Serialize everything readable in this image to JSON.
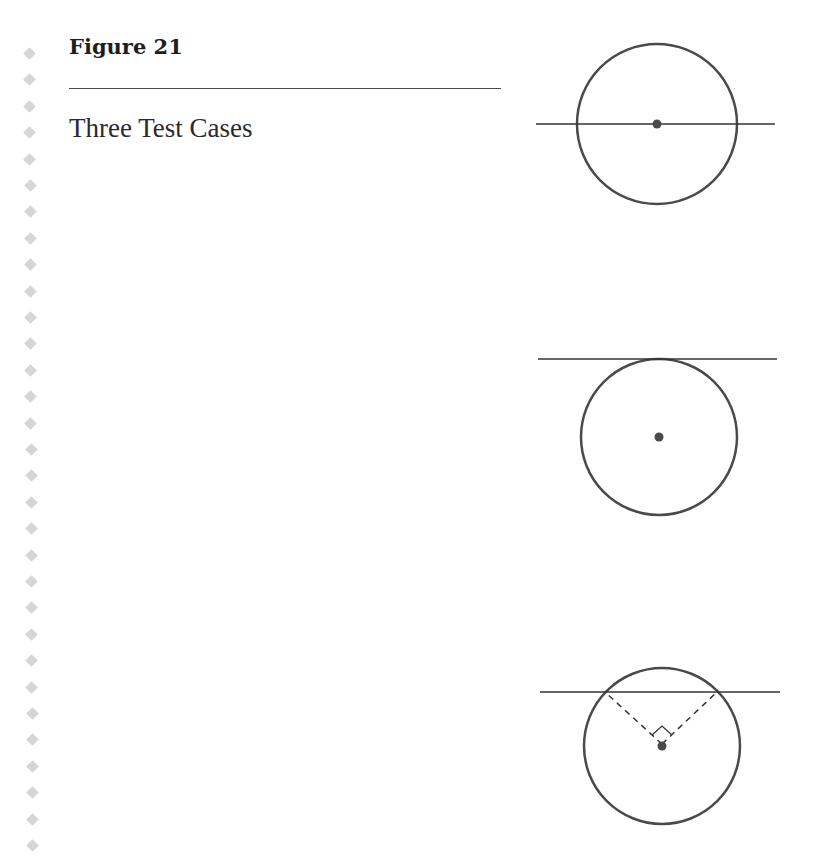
{
  "figure": {
    "title": "Figure 21",
    "subtitle": "Three Test Cases"
  },
  "diagram": {
    "colors": {
      "stroke": "#4a4a4a",
      "line": "#333333",
      "center_dot": "#4a4a4a",
      "bullet": "#d6d6d6"
    },
    "cases": [
      {
        "name": "line-through-center",
        "circle": {
          "cx": 657,
          "cy": 124,
          "r": 80
        },
        "line": {
          "x1": 536,
          "x2": 775,
          "y": 124
        }
      },
      {
        "name": "tangent-line",
        "circle": {
          "cx": 659,
          "cy": 437,
          "r": 78
        },
        "line": {
          "x1": 538,
          "x2": 777,
          "y": 359
        }
      },
      {
        "name": "secant-with-right-angle",
        "circle": {
          "cx": 662,
          "cy": 746,
          "r": 78
        },
        "line": {
          "x1": 540,
          "x2": 780,
          "y": 692
        },
        "dashed_to": [
          [
            605,
            692
          ],
          [
            717,
            692
          ]
        ]
      }
    ]
  }
}
